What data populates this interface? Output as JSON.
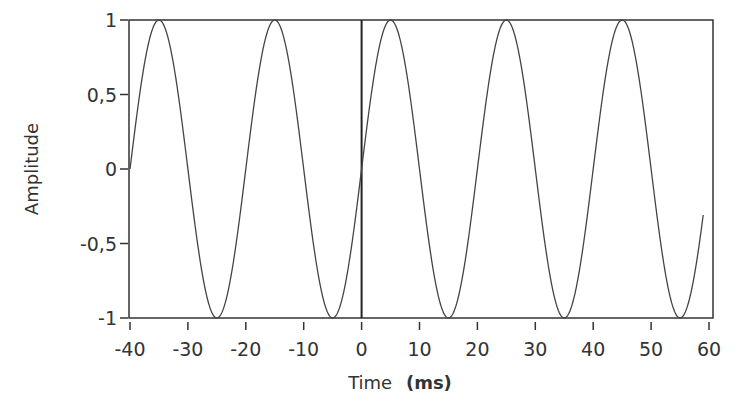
{
  "chart_data": {
    "type": "line",
    "title": "",
    "xlabel": "Time",
    "xlabel_unit": "(ms)",
    "ylabel": "Amplitude",
    "xlim": [
      -40,
      60
    ],
    "ylim": [
      -1,
      1
    ],
    "grid": false,
    "legend": null,
    "x_ticks": [
      -40,
      -30,
      -20,
      -10,
      0,
      10,
      20,
      30,
      40,
      50,
      60
    ],
    "x_tick_labels": [
      "-40",
      "-30",
      "-20",
      "-10",
      "0",
      "10",
      "20",
      "30",
      "40",
      "50",
      "60"
    ],
    "y_ticks": [
      1,
      0.5,
      0,
      -0.5,
      -1
    ],
    "y_tick_labels": [
      "1",
      "0,5",
      "0",
      "-0,5",
      "-1"
    ],
    "annotations": [
      {
        "type": "vertical-line",
        "x": 0,
        "label": ""
      }
    ],
    "series": [
      {
        "name": "sine wave",
        "function": "sin(2*pi*t/20)",
        "frequency_hz": 50,
        "period_ms": 20,
        "amplitude": 1,
        "t_start": -40,
        "t_end": 59,
        "color": "#444444",
        "x": [
          -40,
          -35,
          -30,
          -25,
          -20,
          -15,
          -10,
          -5,
          0,
          5,
          10,
          15,
          20,
          25,
          30,
          35,
          40,
          45,
          50,
          55,
          59
        ],
        "values": [
          0,
          1,
          0,
          -1,
          0,
          1,
          0,
          -1,
          0,
          1,
          0,
          -1,
          0,
          1,
          0,
          -1,
          0,
          1,
          0,
          -1,
          -0.31
        ]
      }
    ]
  },
  "colors": {
    "line": "#444444",
    "axis": "#333333",
    "background": "#ffffff"
  }
}
